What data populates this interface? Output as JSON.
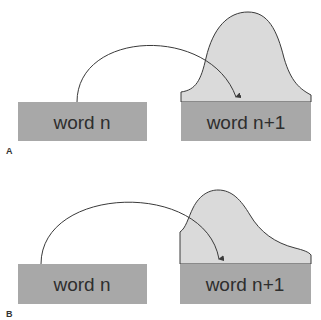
{
  "colors": {
    "box_fill": "#a8a8a8",
    "distribution_fill": "#dadada",
    "stroke": "#3a3a3a",
    "text": "#2e2e2e",
    "background": "#ffffff"
  },
  "panels": [
    {
      "label": "A",
      "source_box": {
        "text": "word n"
      },
      "target_box": {
        "text": "word n+1"
      },
      "distribution_shape": "narrow symmetric bell peaked over target word",
      "arrow": "curved arrow from word n to word n+1"
    },
    {
      "label": "B",
      "source_box": {
        "text": "word n"
      },
      "target_box": {
        "text": "word n+1"
      },
      "distribution_shape": "broad left-skewed hump over target word",
      "arrow": "curved arrow from word n to word n+1"
    }
  ]
}
